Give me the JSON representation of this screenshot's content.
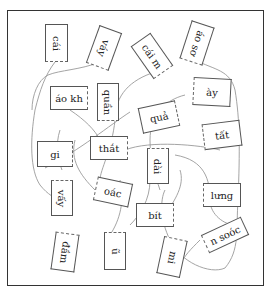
{
  "puzzle": {
    "header_fragment": "",
    "cards": [
      {
        "id": "c1",
        "text": "cái"
      },
      {
        "id": "c2",
        "text": "váy"
      },
      {
        "id": "c3",
        "text": "cái m"
      },
      {
        "id": "c4",
        "text": "áo sơ"
      },
      {
        "id": "c5",
        "text": "áo kh"
      },
      {
        "id": "c6",
        "text": "quần"
      },
      {
        "id": "c7",
        "text": "ày"
      },
      {
        "id": "c8",
        "text": "quả"
      },
      {
        "id": "c9",
        "text": "tất"
      },
      {
        "id": "c10",
        "text": "gi"
      },
      {
        "id": "c11",
        "text": "thắt"
      },
      {
        "id": "c12",
        "text": "dài"
      },
      {
        "id": "c13",
        "text": "vấy"
      },
      {
        "id": "c14",
        "text": "oác"
      },
      {
        "id": "c15",
        "text": "lưng"
      },
      {
        "id": "c16",
        "text": "bít"
      },
      {
        "id": "c17",
        "text": "n soóc"
      },
      {
        "id": "c18",
        "text": "đầm"
      },
      {
        "id": "c19",
        "text": "ũ"
      },
      {
        "id": "c20",
        "text": "mi"
      }
    ]
  }
}
